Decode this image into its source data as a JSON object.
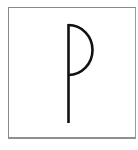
{
  "symbol": {
    "name": "rune-p-symbol",
    "description": "Vertical stem with a half-circle bowl on the upper right",
    "stroke_color": "#111111",
    "frame_color": "#8a8a8a",
    "background": "#ffffff"
  }
}
